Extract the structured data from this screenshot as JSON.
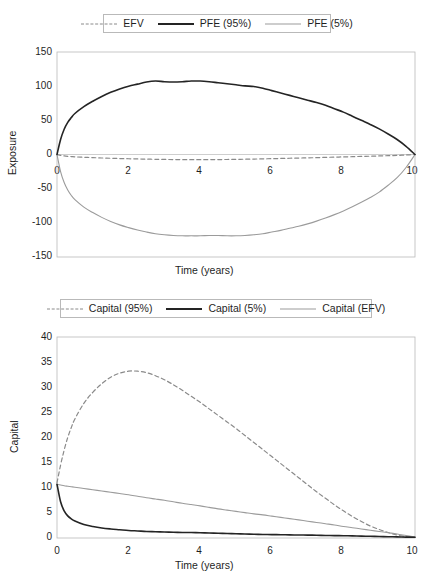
{
  "figures": [
    {
      "id": "exposure",
      "legend": {
        "items": [
          {
            "label": "EFV",
            "style": "dashed-gray"
          },
          {
            "label": "PFE (95%)",
            "style": "solid-black"
          },
          {
            "label": "PFE (5%)",
            "style": "solid-gray"
          }
        ]
      },
      "chart_data": {
        "type": "line",
        "title": "",
        "xlabel": "Time (years)",
        "ylabel": "Exposure",
        "xlim": [
          0,
          10
        ],
        "ylim": [
          -150,
          150
        ],
        "xticks": [
          0,
          2,
          4,
          6,
          8,
          10
        ],
        "yticks": [
          -150,
          -100,
          -50,
          0,
          50,
          100,
          150
        ],
        "grid": false,
        "legend_position": "above-plot",
        "x": [
          0,
          0.1,
          0.2,
          0.3,
          0.4,
          0.5,
          0.75,
          1,
          1.25,
          1.5,
          1.75,
          2,
          2.25,
          2.5,
          2.75,
          3,
          3.25,
          3.5,
          3.75,
          4,
          4.25,
          4.5,
          4.75,
          5,
          5.25,
          5.5,
          5.75,
          6,
          6.25,
          6.5,
          6.75,
          7,
          7.25,
          7.5,
          7.75,
          8,
          8.25,
          8.5,
          8.75,
          9,
          9.25,
          9.5,
          9.75,
          10
        ],
        "series": [
          {
            "name": "PFE (95%)",
            "style": "solid-black",
            "values": [
              0,
              22,
              37,
              47,
              54,
              60,
              70,
              78,
              85,
              91,
              96,
              100,
              103,
              106,
              107.5,
              106.5,
              106,
              106.5,
              107.5,
              107.5,
              106.5,
              105,
              103.5,
              102,
              100.5,
              99.5,
              97,
              93.5,
              90,
              86.5,
              83,
              79.5,
              76,
              72,
              67,
              62,
              56,
              50,
              44,
              37.5,
              30,
              22,
              12,
              0
            ]
          },
          {
            "name": "PFE (5%)",
            "style": "solid-gray",
            "values": [
              0,
              -25,
              -41,
              -52,
              -60,
              -66,
              -77,
              -85,
              -92,
              -98,
              -103,
              -107,
              -110.5,
              -113.5,
              -116,
              -117.5,
              -118.5,
              -119,
              -119,
              -119,
              -118.5,
              -118.5,
              -119,
              -119,
              -118.5,
              -117.5,
              -116,
              -113.5,
              -111,
              -108,
              -105,
              -101.5,
              -97.5,
              -93,
              -88,
              -82.5,
              -76.5,
              -70,
              -63,
              -55,
              -45,
              -34,
              -19,
              0
            ]
          },
          {
            "name": "EFV",
            "style": "dashed-gray",
            "values": [
              0,
              -1.2,
              -2,
              -2.6,
              -3,
              -3.4,
              -4.1,
              -4.6,
              -5.1,
              -5.5,
              -5.9,
              -6.2,
              -6.5,
              -6.8,
              -7,
              -7.2,
              -7.4,
              -7.5,
              -7.6,
              -7.6,
              -7.5,
              -7.4,
              -7.3,
              -7.1,
              -6.9,
              -6.7,
              -6.4,
              -6.1,
              -5.8,
              -5.5,
              -5.2,
              -4.9,
              -4.6,
              -4.2,
              -3.9,
              -3.5,
              -3.2,
              -2.8,
              -2.5,
              -2.1,
              -1.7,
              -1.3,
              -0.7,
              0
            ]
          }
        ]
      }
    },
    {
      "id": "capital",
      "legend": {
        "items": [
          {
            "label": "Capital (95%)",
            "style": "dashed-gray"
          },
          {
            "label": "Capital (5%)",
            "style": "solid-black"
          },
          {
            "label": "Capital (EFV)",
            "style": "solid-gray"
          }
        ]
      },
      "chart_data": {
        "type": "line",
        "title": "",
        "xlabel": "Time (years)",
        "ylabel": "Capital",
        "xlim": [
          0,
          10
        ],
        "ylim": [
          0,
          40
        ],
        "xticks": [
          0,
          2,
          4,
          6,
          8,
          10
        ],
        "yticks": [
          0,
          5,
          10,
          15,
          20,
          25,
          30,
          35,
          40
        ],
        "grid": false,
        "legend_position": "above-plot",
        "x": [
          0,
          0.1,
          0.2,
          0.3,
          0.4,
          0.5,
          0.75,
          1,
          1.25,
          1.5,
          1.75,
          2,
          2.25,
          2.5,
          2.75,
          3,
          3.25,
          3.5,
          3.75,
          4,
          4.25,
          4.5,
          4.75,
          5,
          5.25,
          5.5,
          5.75,
          6,
          6.25,
          6.5,
          6.75,
          7,
          7.25,
          7.5,
          7.75,
          8,
          8.25,
          8.5,
          8.75,
          9,
          9.25,
          9.5,
          9.75,
          10
        ],
        "series": [
          {
            "name": "Capital (95%)",
            "style": "dashed-gray",
            "values": [
              11,
              14.5,
              17.5,
              20,
              22,
              23.7,
              26.8,
              29,
              30.7,
              32,
              32.8,
              33.2,
              33.2,
              32.9,
              32.3,
              31.5,
              30.5,
              29.4,
              28.2,
              27,
              25.7,
              24.4,
              23.1,
              21.8,
              20.4,
              19,
              17.6,
              16.2,
              14.8,
              13.4,
              12,
              10.6,
              9.2,
              7.9,
              6.6,
              5.4,
              4.3,
              3.3,
              2.4,
              1.7,
              1.1,
              0.6,
              0.3,
              0.15
            ]
          },
          {
            "name": "Capital (5%)",
            "style": "solid-black",
            "values": [
              10.7,
              7.2,
              5.4,
              4.4,
              3.8,
              3.4,
              2.7,
              2.3,
              2,
              1.8,
              1.65,
              1.5,
              1.4,
              1.3,
              1.25,
              1.2,
              1.15,
              1.1,
              1.08,
              1.05,
              1,
              0.95,
              0.9,
              0.85,
              0.8,
              0.75,
              0.7,
              0.68,
              0.65,
              0.62,
              0.6,
              0.58,
              0.55,
              0.5,
              0.48,
              0.45,
              0.42,
              0.38,
              0.34,
              0.3,
              0.26,
              0.22,
              0.18,
              0.15
            ]
          },
          {
            "name": "Capital (EFV)",
            "style": "solid-gray",
            "values": [
              10.7,
              10.55,
              10.4,
              10.3,
              10.2,
              10.1,
              9.85,
              9.6,
              9.35,
              9.1,
              8.85,
              8.6,
              8.3,
              8,
              7.75,
              7.5,
              7.2,
              6.9,
              6.65,
              6.4,
              6.1,
              5.8,
              5.55,
              5.3,
              5.05,
              4.8,
              4.6,
              4.35,
              4.1,
              3.85,
              3.6,
              3.35,
              3.1,
              2.85,
              2.6,
              2.3,
              2.05,
              1.8,
              1.55,
              1.3,
              1.05,
              0.8,
              0.5,
              0.2
            ]
          }
        ]
      }
    }
  ],
  "colors": {
    "solid_black": "#242424",
    "solid_gray": "#9b9b9b",
    "dashed_gray": "#8a8a8a",
    "axis": "#b9b9b9",
    "text": "#1f1f1f"
  }
}
